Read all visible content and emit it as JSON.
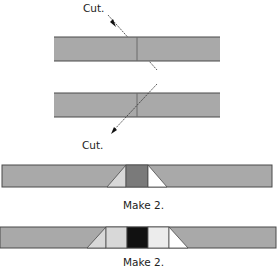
{
  "diagram": {
    "labels": {
      "cut_top": "Cut.",
      "cut_bottom": "Cut.",
      "make_first": "Make 2.",
      "make_second": "Make 2."
    },
    "colors": {
      "strip_gray": "#a9a9a9",
      "outline": "#4a4a4a",
      "dark_gray": "#7a7a7a",
      "light_gray": "#d8d8d8",
      "black": "#111111",
      "white": "#ffffff"
    }
  }
}
